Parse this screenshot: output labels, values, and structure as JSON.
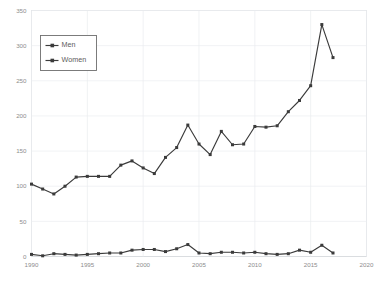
{
  "chart_data": {
    "type": "line",
    "title": "",
    "subtitle": "",
    "xlabel": "",
    "ylabel": "",
    "xlim": [
      1990,
      2020
    ],
    "ylim": [
      0,
      350
    ],
    "grid": true,
    "legend_position": "top-left",
    "x": [
      1990,
      1991,
      1992,
      1993,
      1994,
      1995,
      1996,
      1997,
      1998,
      1999,
      2000,
      2001,
      2002,
      2003,
      2004,
      2005,
      2006,
      2007,
      2008,
      2009,
      2010,
      2011,
      2012,
      2013,
      2014,
      2015,
      2016,
      2017
    ],
    "xticks": [
      1990,
      1995,
      2000,
      2005,
      2010,
      2015,
      2020
    ],
    "xtick_labels": [
      "1990",
      "1995",
      "2000",
      "2005",
      "2010",
      "2015",
      "2020"
    ],
    "yticks": [
      0,
      50,
      100,
      150,
      200,
      250,
      300,
      350
    ],
    "ytick_labels": [
      "0",
      "50",
      "100",
      "150",
      "200",
      "250",
      "300",
      "350"
    ],
    "series": [
      {
        "name": "Men",
        "color": "#3b3b3b",
        "values": [
          103,
          96,
          89,
          100,
          113,
          114,
          114,
          114,
          130,
          136,
          126,
          118,
          141,
          155,
          187,
          160,
          145,
          178,
          159,
          160,
          185,
          184,
          186,
          206,
          222,
          243,
          330,
          283
        ]
      },
      {
        "name": "Women",
        "color": "#3b3b3b",
        "values": [
          3,
          1,
          4,
          3,
          2,
          3,
          4,
          5,
          5,
          9,
          10,
          10,
          7,
          11,
          17,
          5,
          4,
          6,
          6,
          5,
          6,
          4,
          3,
          4,
          9,
          6,
          16,
          5
        ]
      }
    ],
    "legend": [
      {
        "label": "Men"
      },
      {
        "label": "Women"
      }
    ]
  },
  "colors": {
    "background": "#ffffff",
    "gridline": "#e9ecef",
    "axis": "#d8dade",
    "series": "#3b3b3b",
    "tick_text": "#8d8d8d",
    "legend_text": "#5b5b5b",
    "legend_border": "#6e6e6e"
  }
}
